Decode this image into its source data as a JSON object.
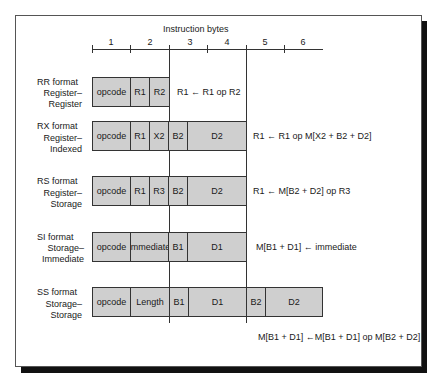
{
  "figure": {
    "title": "Instruction bytes",
    "byte_labels": [
      "1",
      "2",
      "3",
      "4",
      "5",
      "6"
    ]
  },
  "formats": [
    {
      "name": "RR format",
      "subtitle_line1": "Register–",
      "subtitle_line2": "Register",
      "fields": [
        "opcode",
        "R1",
        "R2"
      ],
      "operation": "R1 ← R1 op R2"
    },
    {
      "name": "RX format",
      "subtitle_line1": "Register–",
      "subtitle_line2": "Indexed",
      "fields": [
        "opcode",
        "R1",
        "X2",
        "B2",
        "D2"
      ],
      "operation": "R1 ← R1 op M[X2 + B2 + D2]"
    },
    {
      "name": "RS format",
      "subtitle_line1": "Register–",
      "subtitle_line2": "Storage",
      "fields": [
        "opcode",
        "R1",
        "R3",
        "B2",
        "D2"
      ],
      "operation": "R1 ← M[B2 + D2] op R3"
    },
    {
      "name": "SI format",
      "subtitle_line1": "Storage–",
      "subtitle_line2": "Immediate",
      "fields": [
        "opcode",
        "immediate",
        "B1",
        "D1"
      ],
      "operation": "M[B1 + D1] ← immediate"
    },
    {
      "name": "SS format",
      "subtitle_line1": "Storage–",
      "subtitle_line2": "Storage",
      "fields": [
        "opcode",
        "Length",
        "B1",
        "D1",
        "B2",
        "D2"
      ],
      "operation": "M[B1 + D1] ←M[B1 + D1] op  M[B2 + D2]"
    }
  ],
  "colors": {
    "field_fill": "#cfcfcf",
    "line": "#333333",
    "shadow": "#111111"
  }
}
